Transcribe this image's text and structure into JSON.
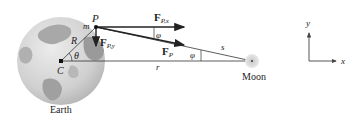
{
  "labels": {
    "point_P": "P",
    "mass_m": "m",
    "radius_R": "R",
    "center_C": "C",
    "angle_theta": "θ",
    "force_x_main": "F",
    "force_x_sub": "P,x",
    "force_y_main": "F",
    "force_y_sub": "P,y",
    "force_main": "F",
    "force_sub": "P",
    "angle_phi_1": "φ",
    "angle_phi_2": "φ",
    "distance_r": "r",
    "distance_s": "s",
    "moon": "Moon",
    "earth": "Earth",
    "axis_x": "x",
    "axis_y": "y"
  },
  "colors": {
    "earth_ocean": "#d4d4d4",
    "earth_land": "#9a9a9a",
    "moon": "#d0d0d0",
    "lines": "#222222"
  }
}
